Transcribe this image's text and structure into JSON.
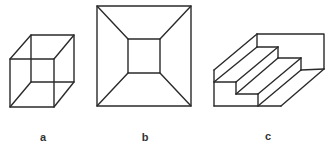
{
  "figures": [
    {
      "id": "a",
      "label": "a",
      "description": "Necker cube (wireframe cube)"
    },
    {
      "id": "b",
      "label": "b",
      "description": "Square within square with connecting diagonals (truncated pyramid / corridor)"
    },
    {
      "id": "c",
      "label": "c",
      "description": "Schroeder staircase"
    }
  ],
  "colors": {
    "stroke": "#2a2a2a",
    "background": "#ffffff"
  }
}
